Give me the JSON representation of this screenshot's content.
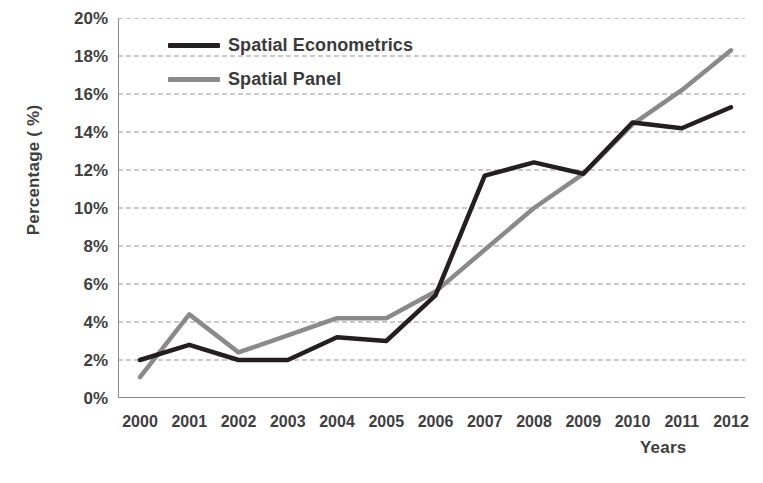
{
  "chart_data": {
    "type": "line",
    "title": "",
    "xlabel": "Years",
    "ylabel": "Percentage ( %)",
    "categories": [
      "2000",
      "2001",
      "2002",
      "2003",
      "2004",
      "2005",
      "2006",
      "2007",
      "2008",
      "2009",
      "2010",
      "2011",
      "2012"
    ],
    "ylim": [
      0,
      20
    ],
    "ytick_labels": [
      "0%",
      "2%",
      "4%",
      "6%",
      "8%",
      "10%",
      "12%",
      "14%",
      "16%",
      "18%",
      "20%"
    ],
    "ytick_values": [
      0,
      2,
      4,
      6,
      8,
      10,
      12,
      14,
      16,
      18,
      20
    ],
    "grid": "horizontal-dashed",
    "legend_position": "upper-left-inside",
    "series": [
      {
        "name": "Spatial Econometrics",
        "color": "#231f20",
        "values": [
          2.0,
          2.8,
          2.0,
          2.0,
          3.2,
          3.0,
          5.4,
          11.7,
          12.4,
          11.8,
          14.5,
          14.2,
          15.3
        ]
      },
      {
        "name": "Spatial Panel",
        "color": "#8a8a8a",
        "values": [
          1.1,
          4.4,
          2.4,
          3.3,
          4.2,
          4.2,
          5.6,
          7.8,
          10.0,
          11.8,
          14.4,
          16.2,
          18.3
        ]
      }
    ]
  },
  "axis": {
    "y_title": "Percentage ( %)",
    "x_title": "Years"
  },
  "colors": {
    "series_1": "#231f20",
    "series_2": "#8a8a8a",
    "grid": "#b9b9b9",
    "axis": "#808080",
    "text": "#3f3f3f",
    "background": "#ffffff"
  }
}
